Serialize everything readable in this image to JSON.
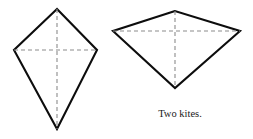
{
  "figure": {
    "caption": "Two kites.",
    "background_color": "#ffffff",
    "outline_color": "#0d0d0d",
    "diagonal_color": "#8c8c8c",
    "caption_color": "#1a1a1a",
    "width": 253,
    "height": 139
  },
  "chart_data": {
    "type": "diagram",
    "title": "Two kites.",
    "xlabel": "",
    "ylabel": "",
    "grid": false,
    "legend": false,
    "shapes": [
      {
        "name": "kite-left",
        "label": "tall narrow kite",
        "vertices": [
          {
            "role": "top-apex",
            "x": 57,
            "y": 9
          },
          {
            "role": "left",
            "x": 14,
            "y": 50
          },
          {
            "role": "bottom-apex",
            "x": 57,
            "y": 129
          },
          {
            "role": "right",
            "x": 97,
            "y": 50
          }
        ],
        "polygon_points": "57,9 14,50 57,129 97,50",
        "diagonals": [
          {
            "name": "vertical-axis-of-symmetry",
            "x1": 57,
            "y1": 9,
            "x2": 57,
            "y2": 129
          },
          {
            "name": "horizontal-cross-diagonal",
            "x1": 14,
            "y1": 50,
            "x2": 97,
            "y2": 50
          }
        ]
      },
      {
        "name": "kite-right",
        "label": "wide short kite",
        "vertices": [
          {
            "role": "top-apex",
            "x": 175,
            "y": 11
          },
          {
            "role": "left",
            "x": 113,
            "y": 31
          },
          {
            "role": "bottom-apex",
            "x": 175,
            "y": 88
          },
          {
            "role": "right",
            "x": 240,
            "y": 31
          }
        ],
        "polygon_points": "175,11 113,31 175,88 240,31",
        "diagonals": [
          {
            "name": "vertical-axis-of-symmetry",
            "x1": 175,
            "y1": 11,
            "x2": 175,
            "y2": 88
          },
          {
            "name": "horizontal-cross-diagonal",
            "x1": 113,
            "y1": 31,
            "x2": 240,
            "y2": 31
          }
        ]
      }
    ]
  }
}
